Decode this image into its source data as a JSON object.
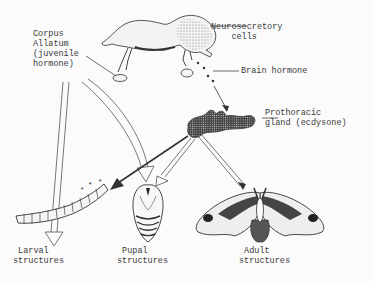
{
  "diagram": {
    "type": "insect-metamorphosis-hormone-control",
    "labels": {
      "corpus_allatum": "Corpus\nAllatum\n(juvenile\nhormone)",
      "neurosecretory": "Neurosecretory\n    cells",
      "brain_hormone": "Brain hormone",
      "prothoracic": "Prothoracic\ngland (ecdysone)",
      "larval": " Larval\nstructures",
      "pupal": " Pupal\nstructures",
      "adult": " Adult\nstructures"
    },
    "nodes": [
      {
        "id": "brain",
        "name": "Brain with neurosecretory cells"
      },
      {
        "id": "corpus_allatum",
        "name": "Corpus Allatum (juvenile hormone)"
      },
      {
        "id": "prothoracic",
        "name": "Prothoracic gland (ecdysone)"
      },
      {
        "id": "larva",
        "name": "Larval structures"
      },
      {
        "id": "pupa",
        "name": "Pupal structures"
      },
      {
        "id": "adult",
        "name": "Adult structures"
      }
    ],
    "edges": [
      {
        "from": "brain",
        "to": "prothoracic",
        "label": "Brain hormone",
        "style": "dotted"
      },
      {
        "from": "corpus_allatum",
        "to": "larva",
        "style": "hollow-arrow"
      },
      {
        "from": "corpus_allatum",
        "to": "pupa",
        "style": "hollow-arrow"
      },
      {
        "from": "prothoracic",
        "to": "larva",
        "style": "solid-arrow"
      },
      {
        "from": "prothoracic",
        "to": "pupa",
        "style": "hollow-arrow"
      },
      {
        "from": "prothoracic",
        "to": "adult",
        "style": "hollow-arrow"
      }
    ],
    "colors": {
      "ink": "#333333",
      "background": "#fbfbfb"
    }
  }
}
